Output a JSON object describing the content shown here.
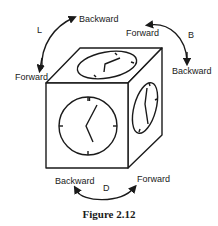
{
  "figure": {
    "caption": "Figure 2.12",
    "rotations": {
      "L": {
        "axis_label": "L",
        "start": "Backward",
        "end": "Forward"
      },
      "B": {
        "axis_label": "B",
        "start": "Forward",
        "end": "Backward"
      },
      "D": {
        "axis_label": "D",
        "start": "Backward",
        "end": "Forward"
      }
    },
    "cube_faces": [
      "front-clock",
      "top-clock",
      "right-clock"
    ],
    "colors": {
      "stroke": "#1a1a1a",
      "background": "#ffffff"
    }
  }
}
